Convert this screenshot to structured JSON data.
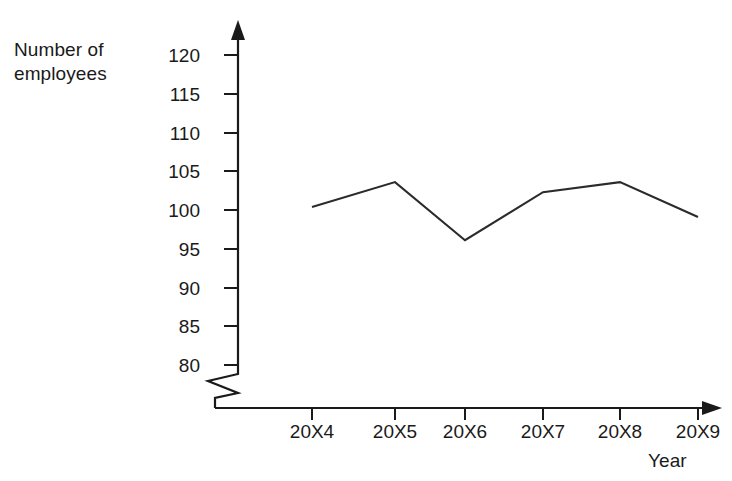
{
  "chart_data": {
    "type": "line",
    "title": "",
    "xlabel": "Year",
    "ylabel": "Number of employees",
    "categories": [
      "20X4",
      "20X5",
      "20X6",
      "20X7",
      "20X8",
      "20X9"
    ],
    "values": [
      100.4,
      103.6,
      96.1,
      102.3,
      103.6,
      99.1
    ],
    "series": [
      {
        "name": "Number of employees",
        "values": [
          100.4,
          103.6,
          96.1,
          102.3,
          103.6,
          99.1
        ]
      }
    ],
    "ylim": [
      80,
      120
    ],
    "y_ticks": [
      80,
      85,
      90,
      95,
      100,
      105,
      110,
      115,
      120
    ],
    "y_tick_labels": [
      "120",
      "115",
      "110",
      "105",
      "100",
      "95",
      "90",
      "85",
      "80"
    ],
    "grid": false,
    "legend": "none",
    "axis_break": true,
    "axis_break_note": "zigzag break on y-axis below 80",
    "line_color": "#2b2b2b",
    "axis_color": "#1a1a1a",
    "background_color": "#ffffff"
  },
  "axes": {
    "y_title": "Number of\nemployees",
    "x_title": "Year"
  },
  "y_ticks": [
    {
      "label": "120"
    },
    {
      "label": "115"
    },
    {
      "label": "110"
    },
    {
      "label": "105"
    },
    {
      "label": "100"
    },
    {
      "label": "95"
    },
    {
      "label": "90"
    },
    {
      "label": "85"
    },
    {
      "label": "80"
    }
  ],
  "x_ticks": [
    {
      "label": "20X4"
    },
    {
      "label": "20X5"
    },
    {
      "label": "20X6"
    },
    {
      "label": "20X7"
    },
    {
      "label": "20X8"
    },
    {
      "label": "20X9"
    }
  ]
}
